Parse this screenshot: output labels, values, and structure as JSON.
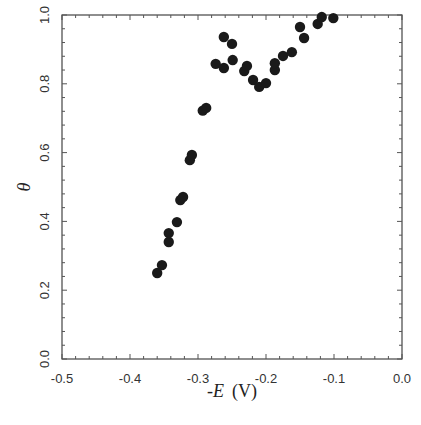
{
  "chart_data": {
    "type": "scatter",
    "title": "",
    "xlabel": "-E (V)",
    "xlabel_var": "-E",
    "xlabel_unit": "(V)",
    "ylabel": "θ",
    "xlim": [
      -0.5,
      0.0
    ],
    "ylim": [
      0.0,
      1.0
    ],
    "x_ticks": [
      -0.5,
      -0.4,
      -0.3,
      -0.2,
      -0.1,
      0.0
    ],
    "x_tick_labels": [
      "-0.5",
      "-0.4",
      "-0.3",
      "-0.2",
      "-0.1",
      "0.0"
    ],
    "y_ticks": [
      0.0,
      0.2,
      0.4,
      0.6,
      0.8,
      1.0
    ],
    "y_tick_labels": [
      "0.0",
      "0.2",
      "0.4",
      "0.6",
      "0.8",
      "1.0"
    ],
    "grid": false,
    "legend": null,
    "marker_color": "#1a1a1a",
    "series": [
      {
        "name": "data",
        "points": [
          [
            -0.36,
            0.25
          ],
          [
            -0.353,
            0.273
          ],
          [
            -0.343,
            0.34
          ],
          [
            -0.343,
            0.366
          ],
          [
            -0.331,
            0.398
          ],
          [
            -0.326,
            0.462
          ],
          [
            -0.322,
            0.471
          ],
          [
            -0.312,
            0.578
          ],
          [
            -0.309,
            0.593
          ],
          [
            -0.293,
            0.722
          ],
          [
            -0.288,
            0.73
          ],
          [
            -0.274,
            0.858
          ],
          [
            -0.262,
            0.846
          ],
          [
            -0.262,
            0.936
          ],
          [
            -0.25,
            0.916
          ],
          [
            -0.249,
            0.869
          ],
          [
            -0.232,
            0.837
          ],
          [
            -0.228,
            0.852
          ],
          [
            -0.219,
            0.811
          ],
          [
            -0.21,
            0.791
          ],
          [
            -0.2,
            0.802
          ],
          [
            -0.187,
            0.84
          ],
          [
            -0.187,
            0.86
          ],
          [
            -0.175,
            0.881
          ],
          [
            -0.162,
            0.892
          ],
          [
            -0.15,
            0.965
          ],
          [
            -0.144,
            0.933
          ],
          [
            -0.124,
            0.974
          ],
          [
            -0.118,
            0.994
          ],
          [
            -0.101,
            0.991
          ]
        ]
      }
    ]
  },
  "caption_partial": "...e 6.10  The ... (caption cut off)"
}
